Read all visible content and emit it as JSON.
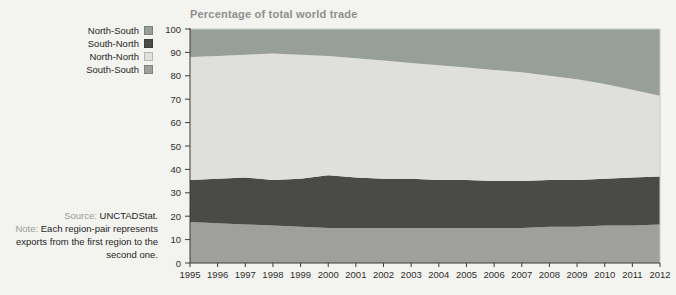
{
  "figure": {
    "title": "Percentage of total world trade"
  },
  "legend": {
    "items": [
      {
        "label": "North-South",
        "color": "#989e9a"
      },
      {
        "label": "South-North",
        "color": "#4a4a48"
      },
      {
        "label": "North-North",
        "color": "#dfdfdb"
      },
      {
        "label": "South-South",
        "color": "#9f9f9b"
      }
    ]
  },
  "notes": {
    "source_label": "Source:",
    "source_value": "UNCTADStat.",
    "note_label": "Note:",
    "note_text": "Each region-pair represents exports from the first region to the second one."
  },
  "chart_data": {
    "type": "area",
    "stacked": true,
    "title": "Percentage of total world trade",
    "xlabel": "",
    "ylabel": "",
    "ylim": [
      0,
      100
    ],
    "ytick_step": 10,
    "grid": false,
    "legend_position": "left",
    "legend_order_top_to_bottom": [
      "North-South",
      "South-North",
      "North-North",
      "South-South"
    ],
    "x": [
      1995,
      1996,
      1997,
      1998,
      1999,
      2000,
      2001,
      2002,
      2003,
      2004,
      2005,
      2006,
      2007,
      2008,
      2009,
      2010,
      2011,
      2012
    ],
    "series": [
      {
        "name": "South-South",
        "color": "#9f9f9b",
        "values": [
          17.5,
          17,
          16.5,
          16,
          15.5,
          15,
          15,
          15,
          15,
          15,
          15,
          15,
          15,
          15.5,
          15.5,
          16,
          16,
          16.5
        ]
      },
      {
        "name": "South-North",
        "color": "#4a4a48",
        "values": [
          18,
          19,
          20,
          19.5,
          20.5,
          22.5,
          21.5,
          21,
          21,
          20.5,
          20.5,
          20,
          20,
          20,
          20,
          20,
          20.5,
          20.5
        ]
      },
      {
        "name": "North-North",
        "color": "#dfdfdb",
        "values": [
          52.5,
          52.5,
          52.5,
          54,
          53,
          51,
          51,
          50.5,
          49.5,
          49,
          48,
          47.5,
          46.5,
          44.5,
          43,
          40.5,
          37.5,
          34.5
        ]
      },
      {
        "name": "North-South",
        "color": "#989e9a",
        "values": [
          12,
          11.5,
          11,
          10.5,
          11,
          11.5,
          12.5,
          13.5,
          14.5,
          15.5,
          16.5,
          17.5,
          18.5,
          20,
          21.5,
          23.5,
          26,
          28.5
        ]
      }
    ]
  }
}
